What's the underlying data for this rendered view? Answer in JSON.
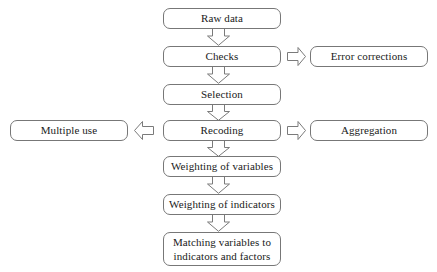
{
  "diagram": {
    "background_color": "#ffffff",
    "border_color": "#777777",
    "text_color": "#1a1a1a",
    "nodes": {
      "raw_data": "Raw data",
      "checks": "Checks",
      "selection": "Selection",
      "recoding": "Recoding",
      "weighting_variables": "Weighting of variables",
      "weighting_indicators": "Weighting of indicators",
      "matching_line1": "Matching variables to",
      "matching_line2": "indicators and factors",
      "error_corrections": "Error corrections",
      "aggregation": "Aggregation",
      "multiple_use": "Multiple use"
    },
    "connectors": [
      {
        "name": "raw-data-to-checks",
        "direction": "down"
      },
      {
        "name": "checks-to-selection",
        "direction": "down"
      },
      {
        "name": "selection-to-recoding",
        "direction": "down"
      },
      {
        "name": "recoding-to-weighting-variables",
        "direction": "down"
      },
      {
        "name": "weighting-variables-to-weighting-indicators",
        "direction": "down"
      },
      {
        "name": "weighting-indicators-to-matching",
        "direction": "down"
      },
      {
        "name": "checks-to-error-corrections",
        "direction": "right"
      },
      {
        "name": "recoding-to-aggregation",
        "direction": "right"
      },
      {
        "name": "recoding-to-multiple-use",
        "direction": "left"
      }
    ]
  }
}
